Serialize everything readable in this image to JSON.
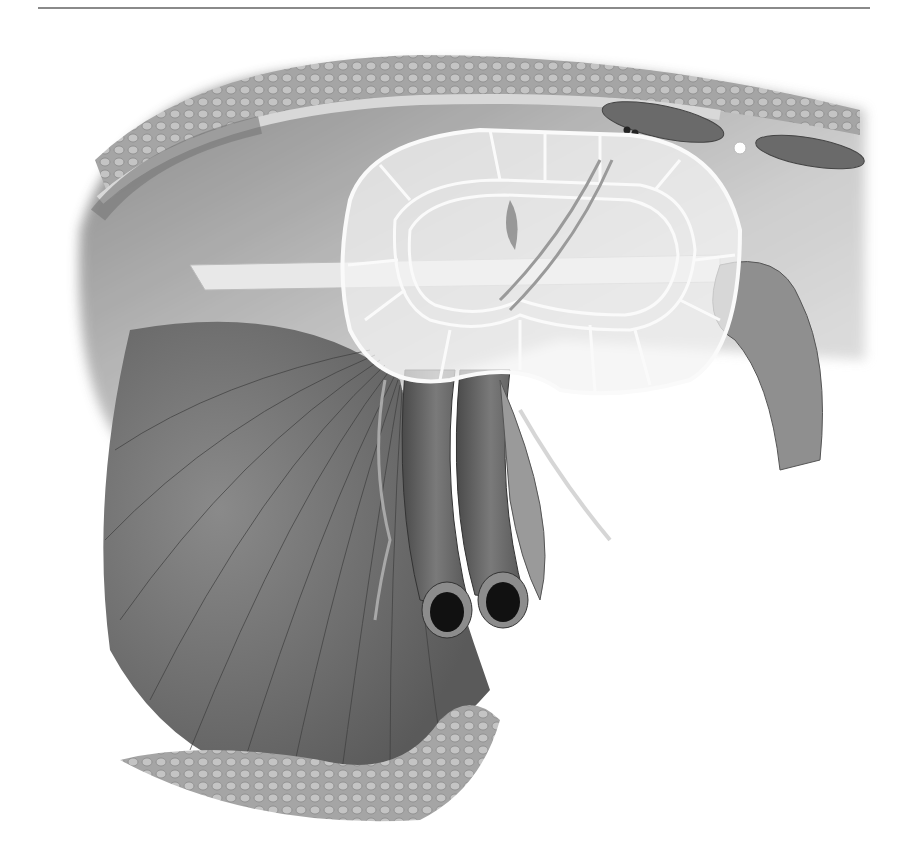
{
  "figure": {
    "type": "anatomical-illustration",
    "style": "grayscale",
    "elements": [
      "abdominal-wall-layers",
      "fat-layer",
      "rectus-muscle-sections",
      "mesh-prosthesis",
      "spermatic-cord",
      "femoral-vessels",
      "fan-shaped-muscle",
      "fatty-tissue"
    ],
    "colors": {
      "background": "#ffffff",
      "rule": "#8a8a8a",
      "muscle": "#6e6e6e",
      "muscle_dark": "#4a4a4a",
      "wall": "#bdbdbd",
      "fat": "#9a9a9a",
      "mesh": "#f4f4f4",
      "vessel": "#5c5c5c",
      "lumen": "#111111"
    }
  }
}
